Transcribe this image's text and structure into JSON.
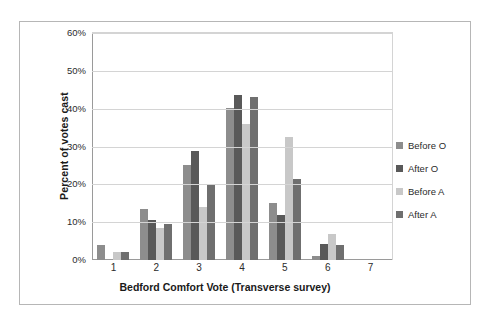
{
  "chart_data": {
    "type": "bar",
    "title": "",
    "xlabel": "Bedford Comfort Vote (Transverse survey)",
    "ylabel": "Percent of votes cast",
    "categories": [
      "1",
      "2",
      "3",
      "4",
      "5",
      "6",
      "7"
    ],
    "ylim": [
      0,
      60
    ],
    "ytick_labels": [
      "0%",
      "10%",
      "20%",
      "30%",
      "40%",
      "50%",
      "60%"
    ],
    "ytick_values": [
      0,
      10,
      20,
      30,
      40,
      50,
      60
    ],
    "grid": true,
    "legend_position": "right",
    "series": [
      {
        "name": "Before  O",
        "color": "#8d8d8d",
        "values": [
          4.0,
          13.5,
          25.0,
          40.3,
          15.0,
          1.0,
          0
        ]
      },
      {
        "name": "After O",
        "color": "#595959",
        "values": [
          0,
          10.5,
          28.8,
          43.5,
          12.0,
          4.3,
          0
        ]
      },
      {
        "name": "Before A",
        "color": "#c8c8c8",
        "values": [
          2.0,
          8.5,
          14.0,
          36.0,
          32.5,
          7.0,
          0
        ]
      },
      {
        "name": "After A",
        "color": "#6f6f6f",
        "values": [
          2.0,
          9.5,
          20.0,
          43.0,
          21.5,
          4.0,
          0
        ]
      }
    ]
  },
  "colors": {
    "frame": "#b6b6b6",
    "gridline": "#d4d4d4",
    "axis": "#9a9a9a",
    "text": "#2b2b2b",
    "background": "#ffffff"
  }
}
